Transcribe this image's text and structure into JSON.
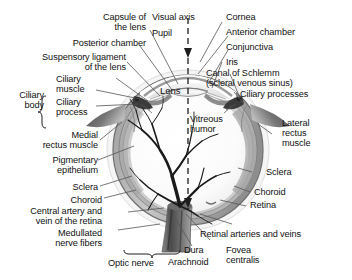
{
  "figure": {
    "kind": "anatomical-diagram",
    "background_color": "#ffffff",
    "ink_color": "#111111",
    "leader_line_color": "#555555"
  },
  "labels": {
    "capsule_of_the_lens": "Capsule of\nthe lens",
    "visual_axis": "Visual axis",
    "cornea": "Cornea",
    "posterior_chamber": "Posterior chamber",
    "pupil": "Pupil",
    "anterior_chamber": "Anterior chamber",
    "suspensory_ligament": "Suspensory ligament\nof the lens",
    "conjunctiva": "Conjunctiva",
    "iris": "Iris",
    "ciliary_muscle": "Ciliary\nmuscle",
    "ciliary_body": "Ciliary\nbody",
    "lens": "Lens",
    "canal_of_schlemm": "Canal of Schlemm\n(scleral venous sinus)",
    "ciliary_process": "Ciliary\nprocess",
    "ciliary_processes": "Ciliary processes",
    "medial_rectus_muscle": "Medial\nrectus muscle",
    "vitreous_humor": "Vitreous\nhumor",
    "lateral_rectus_muscle": "Lateral\nrectus\nmuscle",
    "pigmentary_epithelium": "Pigmentary\nepithelium",
    "sclera_left": "Sclera",
    "sclera_right": "Sclera",
    "choroid_left": "Choroid",
    "choroid_right": "Choroid",
    "central_artery_and_vein": "Central artery and\nvein of the retina",
    "retina": "Retina",
    "medullated_nerve_fibers": "Medullated\nnerve fibers",
    "retinal_arteries_and_veins": "Retinal arteries and veins",
    "dura": "Dura",
    "arachnoid": "Arachnoid",
    "optic_nerve": "Optic nerve",
    "fovea_centralis": "Fovea\ncentralis"
  }
}
